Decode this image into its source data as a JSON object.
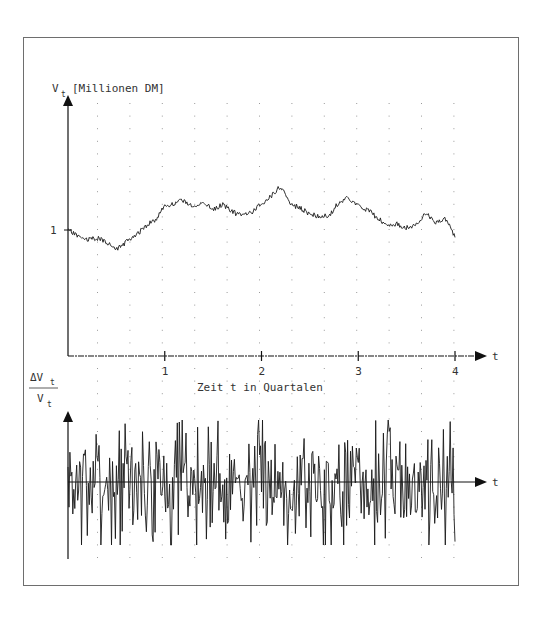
{
  "chart_data": [
    {
      "type": "line",
      "title": "",
      "ylabel": "V_t [Millionen DM]",
      "ylabel_main": "V",
      "ylabel_sub": "t",
      "ylabel_unit": "[Millionen DM]",
      "xlabel": "Zeit t in Quartalen",
      "xaxis_symbol": "t",
      "x_ticks": [
        1,
        2,
        3,
        4
      ],
      "x_tick_labels": [
        "1",
        "2",
        "3",
        "4"
      ],
      "y_ticks": [
        1
      ],
      "y_tick_labels": [
        "1"
      ],
      "xlim": [
        0,
        4
      ],
      "grid": "dotted",
      "legend": null,
      "series": [
        {
          "name": "V_t",
          "description": "simulated firm value path (random walk)",
          "x": [
            0,
            0.1,
            0.2,
            0.3,
            0.4,
            0.5,
            0.6,
            0.7,
            0.8,
            0.9,
            1.0,
            1.1,
            1.2,
            1.3,
            1.4,
            1.5,
            1.6,
            1.7,
            1.8,
            1.9,
            2.0,
            2.1,
            2.2,
            2.3,
            2.4,
            2.5,
            2.6,
            2.7,
            2.8,
            2.9,
            3.0,
            3.1,
            3.2,
            3.3,
            3.4,
            3.5,
            3.6,
            3.7,
            3.8,
            3.9,
            4.0
          ],
          "values": [
            1.0,
            0.97,
            0.95,
            0.96,
            0.94,
            0.9,
            0.94,
            0.97,
            1.02,
            1.05,
            1.12,
            1.13,
            1.15,
            1.11,
            1.14,
            1.1,
            1.13,
            1.09,
            1.07,
            1.09,
            1.13,
            1.17,
            1.22,
            1.13,
            1.11,
            1.08,
            1.07,
            1.07,
            1.14,
            1.16,
            1.12,
            1.1,
            1.06,
            1.02,
            1.03,
            1.01,
            1.03,
            1.08,
            1.04,
            1.06,
            0.96
          ]
        }
      ]
    },
    {
      "type": "line",
      "title": "",
      "ylabel": "ΔV_t / V_t",
      "ylabel_num": "ΔV",
      "ylabel_den": "V",
      "ylabel_sub": "t",
      "xlabel": "",
      "xaxis_symbol": "t",
      "xlim": [
        0,
        4
      ],
      "ylim": [
        -1,
        1
      ],
      "grid": "dotted",
      "legend": null,
      "series": [
        {
          "name": "ΔV_t/V_t",
          "description": "relative changes (noise around zero)",
          "amplitude_rel": 0.45,
          "n_points": 400,
          "seed": 7
        }
      ]
    }
  ],
  "upper_plot": {
    "y_axis_label": "V",
    "y_axis_sub": "t",
    "y_axis_unit": "[Millionen DM]",
    "y_tick": "1",
    "x_axis_symbol": "t",
    "x_tick_labels": [
      "1",
      "2",
      "3",
      "4"
    ],
    "x_axis_title": "Zeit t in Quartalen"
  },
  "lower_plot": {
    "y_num": "ΔV",
    "y_den": "V",
    "y_sub": "t",
    "x_axis_symbol": "t"
  },
  "colors": {
    "line": "#1a1a1a",
    "axis": "#111111",
    "grid": "#9a9a9a",
    "frame": "#6e6e6e"
  }
}
